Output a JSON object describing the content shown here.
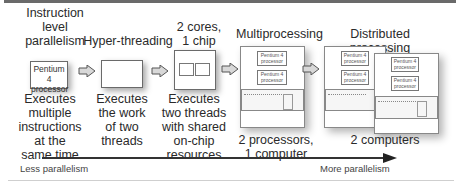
{
  "stages": [
    {
      "heading_lines": [
        "Instruction",
        "level",
        "parallelism"
      ],
      "chip_label_lines": [
        "Pentium 4",
        "processor"
      ],
      "description_lines": [
        "Executes",
        "multiple",
        "instructions",
        "at the",
        "same time"
      ]
    },
    {
      "heading_lines": [
        "Hyper-threading"
      ],
      "description_lines": [
        "Executes",
        "the work",
        "of two",
        "threads"
      ]
    },
    {
      "heading_lines": [
        "2 cores,",
        "1 chip"
      ],
      "description_lines": [
        "Executes",
        "two threads",
        "with shared",
        "on-chip",
        "resources"
      ]
    },
    {
      "heading_lines": [
        "Multiprocessing"
      ],
      "processor_labels": [
        [
          "Pentium 4",
          "processor"
        ],
        [
          "Pentium 4",
          "processor"
        ]
      ],
      "description_lines": [
        "2 processors,",
        "1 computer"
      ]
    },
    {
      "heading_lines": [
        "Distributed processing"
      ],
      "processor_labels": [
        [
          "Pentium 4",
          "processor"
        ],
        [
          "Pentium 4",
          "processor"
        ],
        [
          "Pentium 4",
          "processor"
        ],
        [
          "Pentium 4",
          "processor"
        ]
      ],
      "description_lines": [
        "2 computers"
      ]
    }
  ],
  "axis": {
    "left_label": "Less parallelism",
    "right_label": "More parallelism"
  },
  "icons": {
    "step_arrow": "block-arrow-right-icon",
    "axis_arrow": "arrow-right-icon"
  },
  "colors": {
    "line": "#333333",
    "border": "#6a6a6a",
    "text": "#2a2a2a"
  }
}
